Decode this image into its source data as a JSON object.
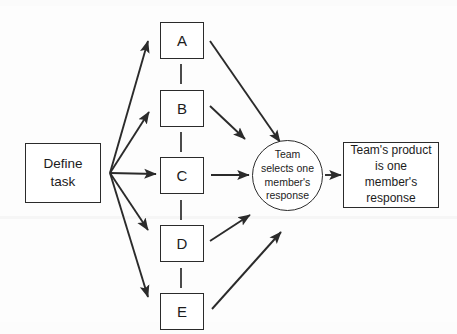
{
  "diagram": {
    "background_color": "#fdfdfd",
    "stroke_color": "#2b2b2b",
    "text_color": "#1c1c1c",
    "start": {
      "id": "define-task",
      "label": "Define task",
      "shape": "rectangle"
    },
    "members": [
      {
        "id": "member-a",
        "label": "A",
        "shape": "rectangle"
      },
      {
        "id": "member-b",
        "label": "B",
        "shape": "rectangle"
      },
      {
        "id": "member-c",
        "label": "C",
        "shape": "rectangle"
      },
      {
        "id": "member-d",
        "label": "D",
        "shape": "rectangle"
      },
      {
        "id": "member-e",
        "label": "E",
        "shape": "rectangle"
      }
    ],
    "selection": {
      "id": "team-selects",
      "label": "Team selects one member's response",
      "lines": [
        "Team",
        "selects one",
        "member's",
        "response"
      ],
      "shape": "circle"
    },
    "outcome": {
      "id": "team-product",
      "label": "Team's product is one member's response",
      "lines": [
        "Team's product",
        "is one member's",
        "response"
      ],
      "shape": "rectangle"
    },
    "connectors": {
      "fan_out": [
        "define-task to A",
        "define-task to B",
        "define-task to C",
        "define-task to D",
        "define-task to E"
      ],
      "fan_in": [
        "A to team-selects",
        "B to team-selects",
        "C to team-selects",
        "D to team-selects",
        "E to team-selects"
      ],
      "final": "team-selects to team-product",
      "member_links": [
        "A-B",
        "B-C",
        "C-D",
        "D-E"
      ],
      "member_link_style": "dashed-vertical"
    }
  }
}
